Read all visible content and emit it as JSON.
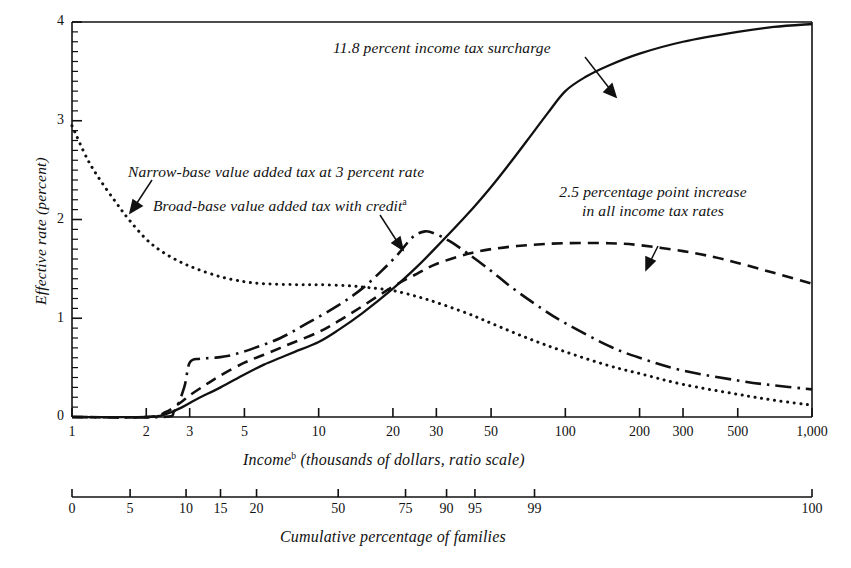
{
  "chart_data": {
    "type": "line",
    "title": "",
    "xlabel": "Income (thousands of dollars, ratio scale)",
    "xlabel_main": "Income",
    "xlabel_sup": "b",
    "xlabel_rest": " (thousands of dollars, ratio scale)",
    "ylabel": "Effective rate (percent)",
    "secondary_xlabel": "Cumulative percentage of families",
    "xscale": "log",
    "xlim": [
      1,
      1000
    ],
    "ylim": [
      0,
      4
    ],
    "grid": false,
    "legend": "inline annotations",
    "xticks": [
      1,
      2,
      3,
      5,
      10,
      20,
      30,
      50,
      100,
      200,
      300,
      500,
      1000
    ],
    "xtick_labels": [
      "1",
      "2",
      "3",
      "5",
      "10",
      "20",
      "30",
      "50",
      "100",
      "200",
      "300",
      "500",
      "1,000"
    ],
    "yticks": [
      0,
      1,
      2,
      3,
      4
    ],
    "ytick_labels": [
      "0",
      "1",
      "2",
      "3",
      "4"
    ],
    "y_minor_step": 0.1,
    "cumulative_ticks": [
      {
        "label": "0",
        "income": 1
      },
      {
        "label": "5",
        "income": 1.72
      },
      {
        "label": "10",
        "income": 2.9
      },
      {
        "label": "15",
        "income": 4.0
      },
      {
        "label": "20",
        "income": 5.6
      },
      {
        "label": "50",
        "income": 12.0
      },
      {
        "label": "75",
        "income": 22.5
      },
      {
        "label": "90",
        "income": 33.0
      },
      {
        "label": "95",
        "income": 43.0
      },
      {
        "label": "99",
        "income": 75.0
      },
      {
        "label": "100",
        "income": 1000
      }
    ],
    "series": [
      {
        "name": "11.8 percent income tax surcharge",
        "style": "solid",
        "annotation": "11.8 percent income tax surcharge",
        "points": [
          [
            1,
            0.0
          ],
          [
            2,
            0.0
          ],
          [
            2.4,
            0.03
          ],
          [
            2.8,
            0.1
          ],
          [
            3.2,
            0.18
          ],
          [
            4,
            0.3
          ],
          [
            5,
            0.43
          ],
          [
            6,
            0.53
          ],
          [
            7,
            0.6
          ],
          [
            8,
            0.66
          ],
          [
            10,
            0.76
          ],
          [
            12,
            0.88
          ],
          [
            15,
            1.05
          ],
          [
            20,
            1.3
          ],
          [
            25,
            1.52
          ],
          [
            30,
            1.72
          ],
          [
            40,
            2.05
          ],
          [
            50,
            2.33
          ],
          [
            60,
            2.58
          ],
          [
            70,
            2.8
          ],
          [
            85,
            3.08
          ],
          [
            100,
            3.3
          ],
          [
            120,
            3.44
          ],
          [
            150,
            3.56
          ],
          [
            200,
            3.68
          ],
          [
            300,
            3.8
          ],
          [
            500,
            3.9
          ],
          [
            700,
            3.95
          ],
          [
            1000,
            3.98
          ]
        ]
      },
      {
        "name": "2.5 percentage point increase in all income tax rates",
        "style": "dashed",
        "annotation": "2.5 percentage point increase in all income tax rates",
        "annotation_line1": "2.5 percentage point increase",
        "annotation_line2": "in all income tax rates",
        "points": [
          [
            1,
            0.0
          ],
          [
            2,
            0.0
          ],
          [
            2.4,
            0.05
          ],
          [
            2.8,
            0.16
          ],
          [
            3,
            0.22
          ],
          [
            3.5,
            0.33
          ],
          [
            4,
            0.42
          ],
          [
            5,
            0.55
          ],
          [
            6,
            0.63
          ],
          [
            7,
            0.7
          ],
          [
            8,
            0.76
          ],
          [
            10,
            0.86
          ],
          [
            12,
            0.97
          ],
          [
            15,
            1.12
          ],
          [
            20,
            1.32
          ],
          [
            25,
            1.45
          ],
          [
            30,
            1.55
          ],
          [
            40,
            1.65
          ],
          [
            50,
            1.7
          ],
          [
            70,
            1.74
          ],
          [
            100,
            1.76
          ],
          [
            150,
            1.76
          ],
          [
            200,
            1.74
          ],
          [
            300,
            1.68
          ],
          [
            400,
            1.62
          ],
          [
            500,
            1.56
          ],
          [
            700,
            1.46
          ],
          [
            1000,
            1.35
          ]
        ]
      },
      {
        "name": "Broad-base value added tax with credit",
        "style": "dash-dot",
        "annotation": "Broad-base value added tax with credit",
        "annotation_sup": "a",
        "points": [
          [
            1,
            0.0
          ],
          [
            2.3,
            0.0
          ],
          [
            2.6,
            0.06
          ],
          [
            2.85,
            0.3
          ],
          [
            3.0,
            0.55
          ],
          [
            3.3,
            0.59
          ],
          [
            3.8,
            0.6
          ],
          [
            4.5,
            0.63
          ],
          [
            5.5,
            0.7
          ],
          [
            7,
            0.8
          ],
          [
            9,
            0.95
          ],
          [
            12,
            1.13
          ],
          [
            15,
            1.3
          ],
          [
            18,
            1.48
          ],
          [
            21,
            1.65
          ],
          [
            24,
            1.82
          ],
          [
            27,
            1.88
          ],
          [
            30,
            1.85
          ],
          [
            34,
            1.78
          ],
          [
            40,
            1.66
          ],
          [
            50,
            1.48
          ],
          [
            60,
            1.32
          ],
          [
            80,
            1.1
          ],
          [
            100,
            0.95
          ],
          [
            150,
            0.72
          ],
          [
            200,
            0.6
          ],
          [
            300,
            0.47
          ],
          [
            500,
            0.37
          ],
          [
            700,
            0.32
          ],
          [
            1000,
            0.28
          ]
        ]
      },
      {
        "name": "Narrow-base value added tax at 3 percent rate",
        "style": "dotted",
        "annotation": "Narrow-base value added tax at 3 percent rate",
        "points": [
          [
            1,
            2.95
          ],
          [
            1.15,
            2.62
          ],
          [
            1.3,
            2.4
          ],
          [
            1.5,
            2.18
          ],
          [
            1.7,
            2.0
          ],
          [
            2,
            1.8
          ],
          [
            2.3,
            1.68
          ],
          [
            2.7,
            1.58
          ],
          [
            3.2,
            1.5
          ],
          [
            4,
            1.42
          ],
          [
            5,
            1.37
          ],
          [
            6,
            1.35
          ],
          [
            8,
            1.34
          ],
          [
            10,
            1.34
          ],
          [
            13,
            1.33
          ],
          [
            16,
            1.31
          ],
          [
            20,
            1.28
          ],
          [
            25,
            1.22
          ],
          [
            30,
            1.16
          ],
          [
            40,
            1.05
          ],
          [
            50,
            0.95
          ],
          [
            70,
            0.8
          ],
          [
            100,
            0.66
          ],
          [
            150,
            0.52
          ],
          [
            200,
            0.44
          ],
          [
            300,
            0.33
          ],
          [
            500,
            0.23
          ],
          [
            700,
            0.17
          ],
          [
            1000,
            0.12
          ]
        ]
      }
    ],
    "annotations": [
      {
        "text": "11.8 percent income tax surcharge",
        "target_x": 130,
        "target_y": 3.45
      },
      {
        "text": "Narrow-base value added tax at 3 percent rate",
        "target_x": 1.75,
        "target_y": 2.05
      },
      {
        "text": "Broad-base value added tax with credit",
        "target_x": 21,
        "target_y": 1.72
      },
      {
        "text": "2.5 percentage point increase in all income tax rates",
        "target_x": 95,
        "target_y": 1.76
      }
    ]
  },
  "colors": {
    "ink": "#111111",
    "background": "#ffffff"
  }
}
